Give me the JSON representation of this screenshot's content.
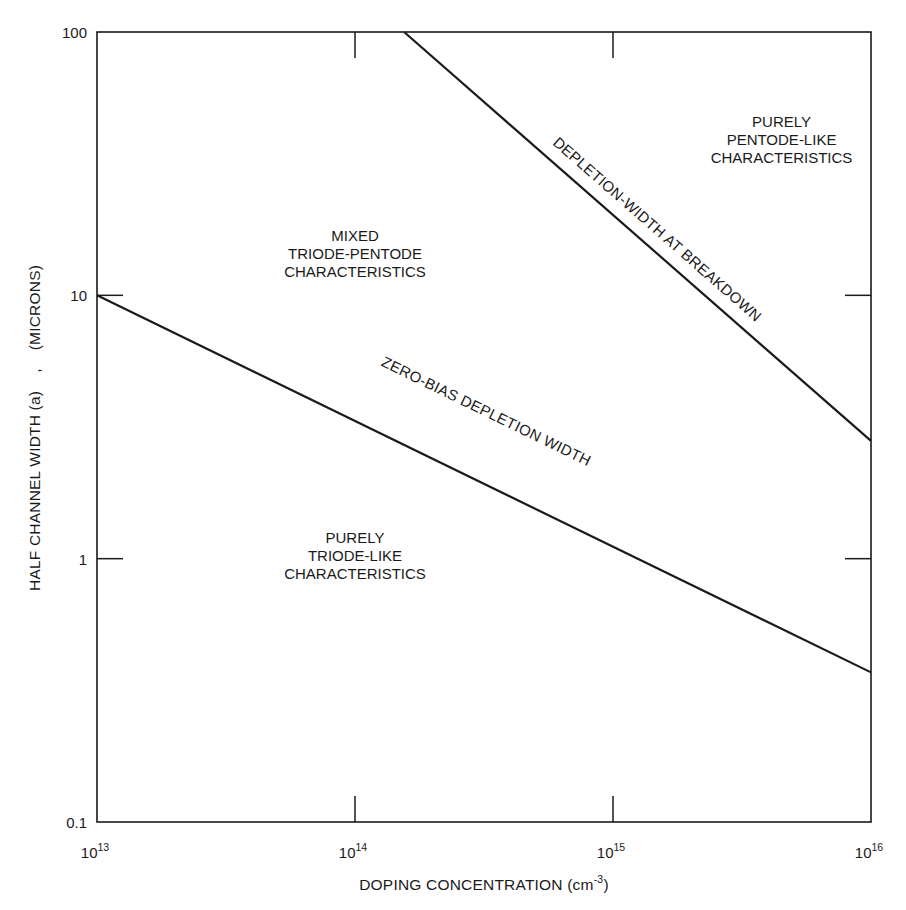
{
  "chart_data": {
    "type": "line",
    "title": "",
    "xscale": "log",
    "yscale": "log",
    "xlabel": "DOPING CONCENTRATION (cm",
    "xlabel_superscript": "-3",
    "xlabel_suffix": ")",
    "ylabel": "HALF CHANNEL WIDTH (a)    ,    (MICRONS)",
    "xlim": [
      10000000000000.0,
      1e+16
    ],
    "ylim": [
      0.1,
      100
    ],
    "grid": false,
    "legend": "none",
    "x_ticks": [
      {
        "value": 10000000000000.0,
        "base": "10",
        "exp": "13"
      },
      {
        "value": 100000000000000.0,
        "base": "10",
        "exp": "14"
      },
      {
        "value": 1000000000000000.0,
        "base": "10",
        "exp": "15"
      },
      {
        "value": 1e+16,
        "base": "10",
        "exp": "16"
      }
    ],
    "y_ticks": [
      {
        "value": 0.1,
        "label": "0.1"
      },
      {
        "value": 1,
        "label": "1"
      },
      {
        "value": 10,
        "label": "10"
      },
      {
        "value": 100,
        "label": "100"
      }
    ],
    "series": [
      {
        "name": "DEPLETION-WIDTH AT BREAKDOWN",
        "x": [
          155000000000000.0,
          1e+16
        ],
        "y": [
          100,
          2.8
        ]
      },
      {
        "name": "ZERO-BIAS DEPLETION WIDTH",
        "x": [
          10000000000000.0,
          1e+16
        ],
        "y": [
          10,
          0.37
        ]
      }
    ],
    "annotations": [
      {
        "lines": [
          "PURELY",
          "PENTODE-LIKE",
          "CHARACTERISTICS"
        ],
        "x": 4500000000000000.0,
        "y": 38
      },
      {
        "lines": [
          "MIXED",
          "TRIODE-PENTODE",
          "CHARACTERISTICS"
        ],
        "x": 100000000000000.0,
        "y": 14
      },
      {
        "lines": [
          "PURELY",
          "TRIODE-LIKE",
          "CHARACTERISTICS"
        ],
        "x": 100000000000000.0,
        "y": 1.0
      }
    ]
  }
}
